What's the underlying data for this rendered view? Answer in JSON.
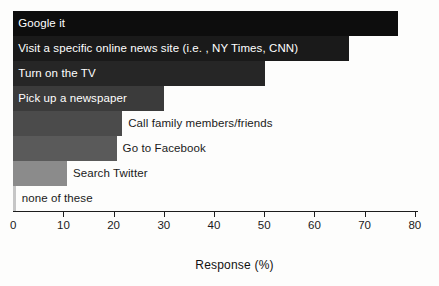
{
  "chart_data": {
    "type": "bar",
    "orientation": "horizontal",
    "title": "",
    "xlabel": "Response (%)",
    "ylabel": "",
    "xlim": [
      0,
      80
    ],
    "grid": false,
    "legend": false,
    "xticks": [
      0,
      10,
      20,
      30,
      40,
      50,
      60,
      70,
      80
    ],
    "xtick_labels": [
      "0",
      "10",
      "20",
      "30",
      "40",
      "50",
      "60",
      "70",
      "80"
    ],
    "categories": [
      "Google it",
      "Visit a specific online news site (i.e. , NY Times, CNN)",
      "Turn on the TV",
      "Pick up a newspaper",
      "Call family members/friends",
      "Go to Facebook",
      "Search Twitter",
      "none of these"
    ],
    "values": [
      76.7,
      66.8,
      50.2,
      30.1,
      21.7,
      20.6,
      10.7,
      0.5
    ],
    "bar_colors": [
      "#0d0d0d",
      "#1a1a1a",
      "#262626",
      "#3b3b3b",
      "#4b4b4b",
      "#5a5a5a",
      "#8b8b8b",
      "#c6c6c6"
    ],
    "label_placement": [
      "inside",
      "inside",
      "inside",
      "inside",
      "outside",
      "outside",
      "outside",
      "outside"
    ]
  }
}
